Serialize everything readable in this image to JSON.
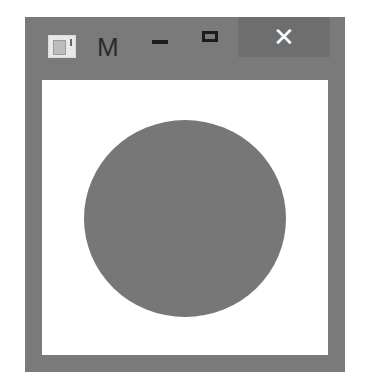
{
  "window": {
    "title": "M",
    "icon": "app-window-icon",
    "controls": {
      "minimize": "minimize-icon",
      "maximize": "maximize-icon",
      "close_label": "✕"
    }
  },
  "canvas": {
    "shape": "circle",
    "fill_color": "#777777",
    "background_color": "#ffffff"
  },
  "colors": {
    "frame": "#7a7a7a",
    "close_button_bg": "#6e6e6e"
  }
}
